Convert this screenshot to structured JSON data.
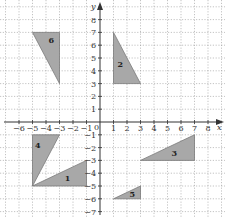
{
  "diagram": {
    "title": "",
    "axes": {
      "x_label": "x",
      "y_label": "y",
      "origin_label": "0",
      "x_ticks": [
        -6,
        -5,
        -4,
        -3,
        -2,
        -1,
        1,
        2,
        3,
        4,
        5,
        6,
        7,
        8
      ],
      "y_ticks": [
        8,
        7,
        6,
        5,
        4,
        3,
        2,
        1,
        -1,
        -2,
        -3,
        -4,
        -5,
        -6,
        -7
      ],
      "x_range": [
        -7,
        9
      ],
      "y_range": [
        -7,
        9
      ]
    },
    "grid": {
      "on": true,
      "style": "dotted"
    },
    "colors": {
      "shape_fill": "#a8a8a8",
      "shape_stroke": "#7a7a7a",
      "axis": "#333333",
      "grid": "#9a9a9a"
    },
    "shapes": [
      {
        "label": "1",
        "vertices": [
          [
            -5,
            -5
          ],
          [
            -1,
            -3
          ],
          [
            -1,
            -5
          ]
        ],
        "label_pos": [
          -2.4,
          -4.4
        ]
      },
      {
        "label": "2",
        "vertices": [
          [
            1,
            7
          ],
          [
            1,
            3
          ],
          [
            3,
            3
          ]
        ],
        "label_pos": [
          1.5,
          4.5
        ]
      },
      {
        "label": "3",
        "vertices": [
          [
            3,
            -3
          ],
          [
            7,
            -1
          ],
          [
            7,
            -3
          ]
        ],
        "label_pos": [
          5.5,
          -2.4
        ]
      },
      {
        "label": "4",
        "vertices": [
          [
            -5,
            -1
          ],
          [
            -3,
            -1
          ],
          [
            -5,
            -5
          ]
        ],
        "label_pos": [
          -4.6,
          -1.8
        ]
      },
      {
        "label": "5",
        "vertices": [
          [
            1,
            -6
          ],
          [
            3,
            -5
          ],
          [
            3,
            -6
          ]
        ],
        "label_pos": [
          2.4,
          -5.6
        ]
      },
      {
        "label": "6",
        "vertices": [
          [
            -5,
            7
          ],
          [
            -3,
            7
          ],
          [
            -3,
            3
          ]
        ],
        "label_pos": [
          -3.6,
          6.4
        ]
      }
    ]
  }
}
